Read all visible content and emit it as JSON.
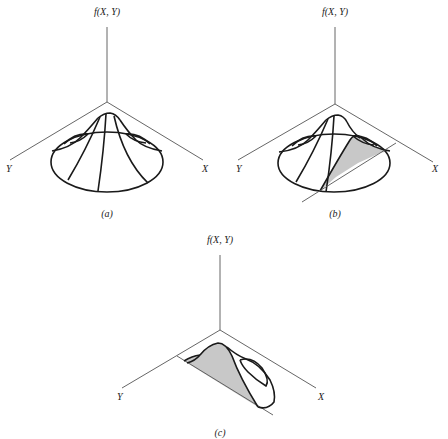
{
  "figure": {
    "panels": [
      {
        "id": "a",
        "caption": "(a)",
        "vertical_axis_label": "f(X, Y)",
        "left_axis_label": "Y",
        "right_axis_label": "X",
        "description": "Bivariate density surface f(X,Y) over elliptical base"
      },
      {
        "id": "b",
        "caption": "(b)",
        "vertical_axis_label": "f(X, Y)",
        "left_axis_label": "Y",
        "right_axis_label": "X",
        "description": "Surface with a vertical slicing plane; shaded cross-section"
      },
      {
        "id": "c",
        "caption": "(c)",
        "vertical_axis_label": "f(X, Y)",
        "left_axis_label": "Y",
        "right_axis_label": "X",
        "description": "Remaining half of surface showing shaded conditional cross-section"
      }
    ],
    "colors": {
      "line": "#1a1a1a",
      "axis": "#555555",
      "shade": "#c8c8c8",
      "background": "#ffffff"
    }
  }
}
